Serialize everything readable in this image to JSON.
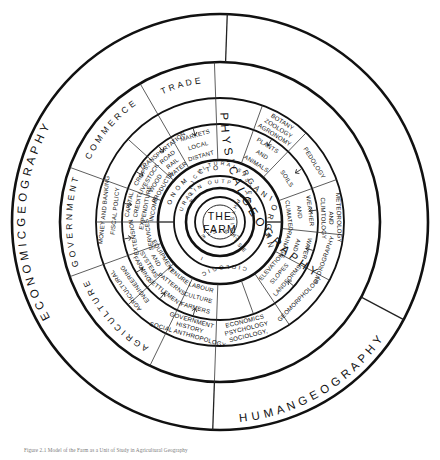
{
  "figure": {
    "center_label_line1": "THE",
    "center_label_line2": "FARM",
    "caption": "Figure 2.1  Model of the Farm as a Unit of Study in Agricultural Geography"
  },
  "rings": {
    "outer": {
      "name": "outer-discipline-ring",
      "segments": [
        {
          "id": "economic-geography",
          "text": "E C O N O M I C   G E O G R A P H Y",
          "start_deg": 182,
          "end_deg": 358
        },
        {
          "id": "human-geography",
          "text": "H U M A N   G E O G R A P H Y",
          "start_deg": 118,
          "end_deg": 182
        },
        {
          "id": "physical-geography",
          "text": "P H Y S I C A L   G E O G R A P H Y",
          "start_deg": 2,
          "end_deg": 118
        }
      ]
    },
    "ring2": {
      "name": "sub-discipline-ring",
      "segments": [
        {
          "id": "agriculture",
          "text": "A G R I C U L T U R E",
          "start_deg": 206,
          "end_deg": 250
        },
        {
          "id": "government",
          "text": "G O V E R N M E N T",
          "start_deg": 250,
          "end_deg": 290
        },
        {
          "id": "commerce",
          "text": "C O M M E R C E",
          "start_deg": 290,
          "end_deg": 330
        },
        {
          "id": "trade",
          "text": "T R A D E",
          "start_deg": 330,
          "end_deg": 358
        }
      ]
    },
    "ring3_specialisms": {
      "name": "specialism-ring",
      "segments": [
        {
          "id": "sociology-psychology-economics",
          "text": "SOCIOLOGY, PSYCHOLOGY ECONOMICS",
          "lines": [
            "SOCIOLOGY,",
            "PSYCHOLOGY",
            "ECONOMICS"
          ]
        },
        {
          "id": "social-anthropology-history-government",
          "text": "SOCIAL ANTHROPOLOGY HISTORY GOVERNMENT",
          "lines": [
            "SOCIAL  ANTHROPOLOGY",
            "HISTORY",
            "GOVERNMENT"
          ]
        },
        {
          "id": "agricultural-engineering",
          "text": "AGRICULTURAL ENGINEERING",
          "lines": [
            "AGRICULTURAL",
            "ENGINEERING"
          ]
        },
        {
          "id": "money-banking-fiscal-policy",
          "text": "MONEY AND BANKING FISCAL POLICY",
          "lines": [
            "MONEY AND BANKING",
            "FISCAL POLICY"
          ]
        },
        {
          "id": "geomorphology",
          "text": "GEOMORPHOLOGY"
        },
        {
          "id": "hydrography",
          "text": "HYDROGRAPHY"
        },
        {
          "id": "meteorology-climtology",
          "text": "METEOROLOGY AND CLIMTOLOGY",
          "lines": [
            "METEOROLOGY",
            "AND",
            "CLIMTOLOGY"
          ]
        },
        {
          "id": "pedology",
          "text": "PEDOLOGY"
        },
        {
          "id": "botany-zoology-agronomy",
          "text": "BOTANY ZOOLOGY AGRONOMY",
          "lines": [
            "BOTANY",
            "ZOOLOGY",
            "AGRONOMY"
          ]
        }
      ]
    },
    "ring4_topics": {
      "name": "topic-ring",
      "segments": [
        {
          "id": "farmers-culture-labour",
          "lines": [
            "FARMERS",
            "CULTURE",
            "LABOUR"
          ]
        },
        {
          "id": "settlement-patterns-tenure",
          "lines": [
            "SETTLEMENT",
            "PATTERNS",
            "TENURE"
          ]
        },
        {
          "id": "farming-systems-and-equipment",
          "lines": [
            "FARMING",
            "SYSTEMS",
            "AND",
            "EQUIPMENT"
          ]
        },
        {
          "id": "extension-services",
          "lines": [
            "EXTENSION",
            "SERVICES"
          ]
        },
        {
          "id": "capital-credit-expenditure-income",
          "lines": [
            "CAPITAL",
            "CREDIT",
            "EXPENDITURE",
            "INCOME"
          ]
        },
        {
          "id": "crops-livestock-wood-products",
          "lines": [
            "CROPS,",
            "LIVESTOCK",
            "WOOD",
            "PRODUCTS"
          ]
        },
        {
          "id": "transportation-road-rail-water",
          "lines": [
            "TRANSPORTATION",
            "ROAD",
            "RAIL",
            "WATER"
          ]
        },
        {
          "id": "markets-local-distant",
          "lines": [
            "MARKETS",
            "LOCAL",
            "DISTANT"
          ]
        },
        {
          "id": "plants-and-animals",
          "lines": [
            "PLANTS",
            "AND",
            "ANIMALS"
          ]
        },
        {
          "id": "soils",
          "lines": [
            "SOILS"
          ]
        },
        {
          "id": "weather-and-climate",
          "lines": [
            "WEATHER",
            "AND",
            "CLIMATE"
          ]
        },
        {
          "id": "water-and-drainage",
          "lines": [
            "WATER",
            "AND",
            "DRAINAGE"
          ]
        },
        {
          "id": "landforms-slopes-elevation",
          "lines": [
            "LANDFORMS",
            "SLOPES",
            "ELEVATION"
          ]
        }
      ]
    },
    "sector_band": {
      "name": "sector-band",
      "top_text": "E C O N O M I C",
      "left_text": "S O C I O L O G I C A L",
      "bottom_left_text": "I N O R G A N I C",
      "bottom_right_text": "O R G A N I C",
      "right_text": "S E C T O R"
    },
    "inner_band": {
      "name": "inputs-outputs-band",
      "left_text": "C U L T U R A L   I N P U T S",
      "right_text": "A N D   O U T P U T S",
      "bottom_text": "I N P U T S   P H Y S I C A L   S E C T O R"
    },
    "core_band": {
      "name": "agricultural-system-band",
      "top_text": "A G R I C U L T U R A L   S Y S T E M",
      "bottom_text": "E C O S Y S T E M"
    }
  }
}
